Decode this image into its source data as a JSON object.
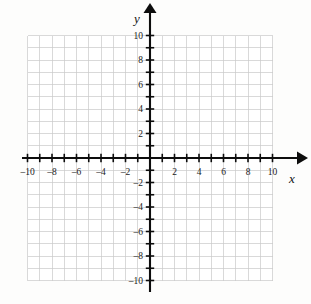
{
  "chart_data": {
    "type": "scatter",
    "title": "",
    "subtitle": "",
    "xlabel": "x",
    "ylabel": "y",
    "xlim": [
      -10,
      10
    ],
    "ylim": [
      -10,
      10
    ],
    "grid": true,
    "legend": null,
    "series": [],
    "x": [],
    "values": [],
    "annotations": [],
    "x_tick_labels": [
      "-10",
      "-8",
      "-6",
      "-4",
      "-2",
      "2",
      "4",
      "6",
      "8",
      "10"
    ],
    "x_tick_values": [
      -10,
      -8,
      -6,
      -4,
      -2,
      2,
      4,
      6,
      8,
      10
    ],
    "y_tick_labels": [
      "10",
      "8",
      "6",
      "4",
      "2",
      "-2",
      "-4",
      "-6",
      "-8",
      "-10"
    ],
    "y_tick_values": [
      10,
      8,
      6,
      4,
      2,
      -2,
      -4,
      -6,
      -8,
      -10
    ],
    "minor_tick_step": 1,
    "major_label_step": 2,
    "origin_label": "",
    "axis_arrows": [
      "x-positive",
      "y-positive"
    ]
  },
  "style": {
    "background": "#fdfdfc",
    "grid_color": "#c9c9c9",
    "axis_color": "#0d0d0d",
    "label_color": "#1a1a1a",
    "plot_fill": "#ffffff"
  },
  "geometry": {
    "origin_x": 150,
    "origin_y": 158,
    "unit_px": 12.25,
    "grid_left": 27.5,
    "grid_right": 272.5,
    "grid_top": 35.5,
    "grid_bottom": 280.5
  },
  "axis_labels": {
    "x_axis_name": "x",
    "y_axis_name": "y"
  }
}
